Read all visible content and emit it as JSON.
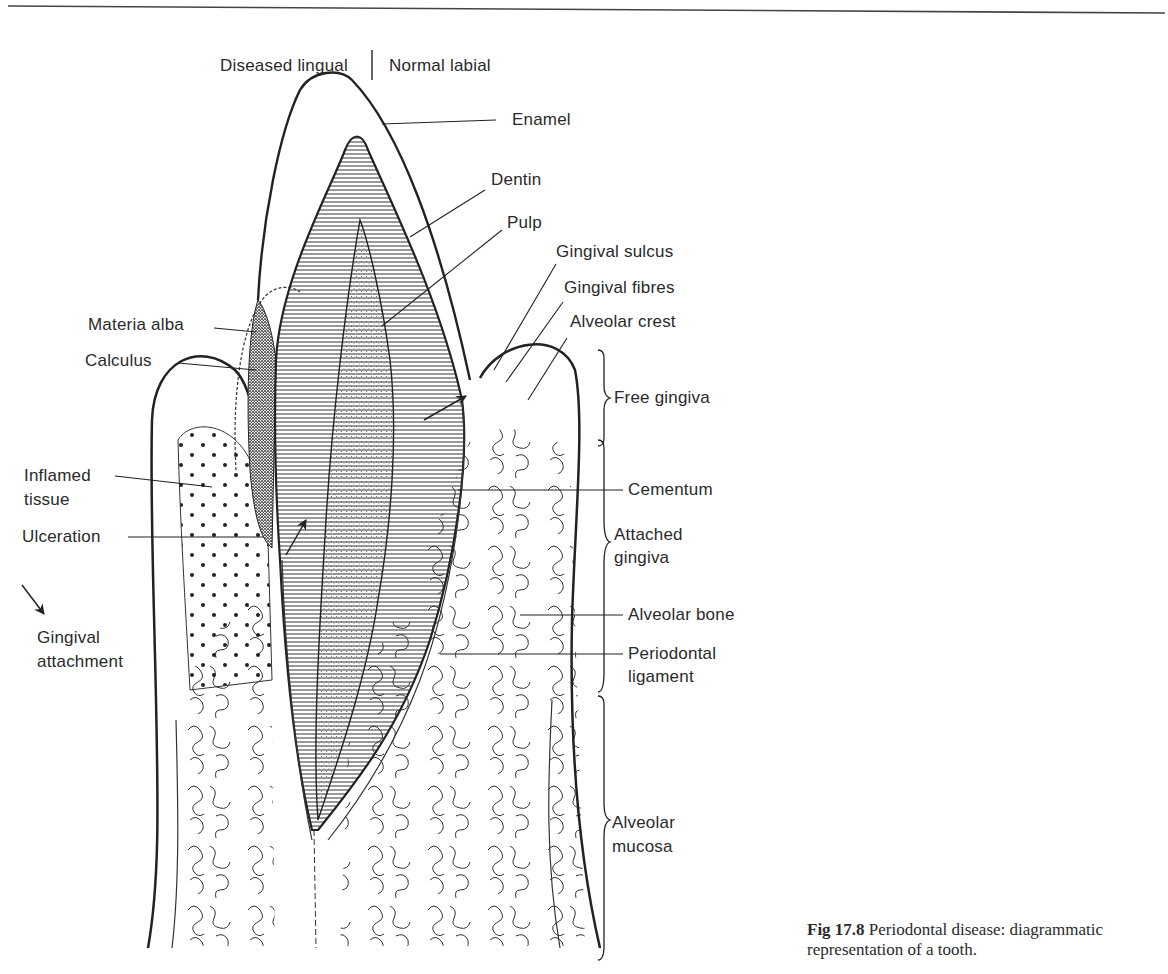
{
  "header": {
    "left_label": "Diseased lingual",
    "right_label": "Normal labial"
  },
  "labels": {
    "enamel": "Enamel",
    "dentin": "Dentin",
    "pulp": "Pulp",
    "gingival_sulcus": "Gingival sulcus",
    "gingival_fibres": "Gingival fibres",
    "alveolar_crest": "Alveolar crest",
    "materia_alba": "Materia alba",
    "calculus": "Calculus",
    "free_gingiva": "Free gingiva",
    "inflamed_tissue_1": "Inflamed",
    "inflamed_tissue_2": "tissue",
    "cementum": "Cementum",
    "ulceration": "Ulceration",
    "attached_gingiva_1": "Attached",
    "attached_gingiva_2": "gingiva",
    "alveolar_bone": "Alveolar bone",
    "gingival_attachment_1": "Gingival",
    "gingival_attachment_2": "attachment",
    "periodontal_ligament_1": "Periodontal",
    "periodontal_ligament_2": "ligament",
    "alveolar_mucosa_1": "Alveolar",
    "alveolar_mucosa_2": "mucosa"
  },
  "caption": {
    "figure_number": "Fig 17.8",
    "text": "Periodontal disease: diagrammatic representation of a tooth."
  },
  "colors": {
    "ink": "#2a2a2a",
    "background": "#ffffff"
  }
}
